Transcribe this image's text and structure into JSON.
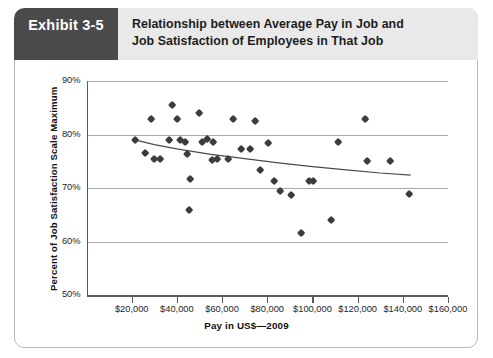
{
  "exhibit": {
    "tab_label": "Exhibit 3-5",
    "title_line1": "Relationship between Average Pay in Job and",
    "title_line2": "Job Satisfaction of Employees in That Job",
    "tab_color": "#4a4a4a",
    "header_bg": "#e9e9e9",
    "marker_color": "#3c3c3c",
    "grid_color": "#a9a9a9",
    "axis_color": "#5a5a5a"
  },
  "chart_data": {
    "type": "scatter",
    "title": "Relationship between Average Pay in Job and Job Satisfaction of Employees in That Job",
    "xlabel": "Pay in US$—2009",
    "ylabel": "Percent of Job Satisfaction Scale Maximum",
    "xlim": [
      0,
      160000
    ],
    "ylim": [
      50,
      90
    ],
    "xticks": [
      20000,
      40000,
      60000,
      80000,
      100000,
      120000,
      140000,
      160000
    ],
    "xtick_labels": [
      "$20,000",
      "$40,000",
      "$60,000",
      "$80,000",
      "$100,000",
      "$120,000",
      "$140,000",
      "$160,000"
    ],
    "yticks": [
      50,
      60,
      70,
      80,
      90
    ],
    "ytick_labels": [
      "50%",
      "60%",
      "70%",
      "80%",
      "90%"
    ],
    "grid": "horizontal",
    "legend": "none",
    "series": [
      {
        "name": "Jobs",
        "marker": "diamond",
        "points": [
          [
            26000,
            76.6
          ],
          [
            28500,
            82.8
          ],
          [
            30000,
            75.4
          ],
          [
            32500,
            75.4
          ],
          [
            38000,
            85.5
          ],
          [
            36500,
            78.9
          ],
          [
            40000,
            82.8
          ],
          [
            43500,
            78.6
          ],
          [
            41500,
            79.0
          ],
          [
            44500,
            76.4
          ],
          [
            46000,
            71.6
          ],
          [
            45500,
            65.8
          ],
          [
            50000,
            84.0
          ],
          [
            51000,
            78.6
          ],
          [
            53500,
            79.1
          ],
          [
            56000,
            78.6
          ],
          [
            55500,
            75.2
          ],
          [
            58000,
            75.3
          ],
          [
            62500,
            75.4
          ],
          [
            65000,
            82.8
          ],
          [
            74500,
            82.5
          ],
          [
            68500,
            77.2
          ],
          [
            72500,
            77.2
          ],
          [
            80500,
            78.3
          ],
          [
            77000,
            73.3
          ],
          [
            83000,
            71.3
          ],
          [
            98500,
            71.2
          ],
          [
            100500,
            71.2
          ],
          [
            85500,
            69.5
          ],
          [
            90500,
            68.6
          ],
          [
            95000,
            61.6
          ],
          [
            108500,
            64.0
          ],
          [
            123500,
            82.8
          ],
          [
            111500,
            78.6
          ],
          [
            124000,
            75.0
          ],
          [
            134500,
            75.0
          ],
          [
            143000,
            68.8
          ],
          [
            21500,
            79.0
          ]
        ]
      }
    ],
    "trendline": {
      "name": "Fitted trend",
      "color": "#4a4a4a",
      "points": [
        [
          21500,
          79.0
        ],
        [
          30000,
          78.1
        ],
        [
          40000,
          77.3
        ],
        [
          55000,
          76.3
        ],
        [
          70000,
          75.5
        ],
        [
          85000,
          74.7
        ],
        [
          100000,
          74.0
        ],
        [
          115000,
          73.4
        ],
        [
          130000,
          72.8
        ],
        [
          143500,
          72.4
        ]
      ]
    }
  }
}
